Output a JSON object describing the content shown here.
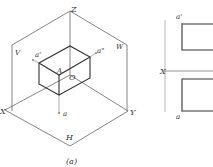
{
  "figure": {
    "caption": "(a)",
    "left_view": {
      "axis_labels": {
        "z": "Z",
        "x": "X",
        "y": "Y"
      },
      "plane_labels": {
        "v": "V",
        "w": "W",
        "h": "H"
      },
      "point_labels": {
        "a_prime": "a'",
        "a_double_prime": "a\"",
        "a": "a",
        "A": "A",
        "O": "O"
      }
    },
    "right_view": {
      "axis_label": "X",
      "point_labels": {
        "a_prime": "a'",
        "a": "a"
      }
    }
  },
  "colors": {
    "line": "#555555",
    "text": "#333333"
  }
}
